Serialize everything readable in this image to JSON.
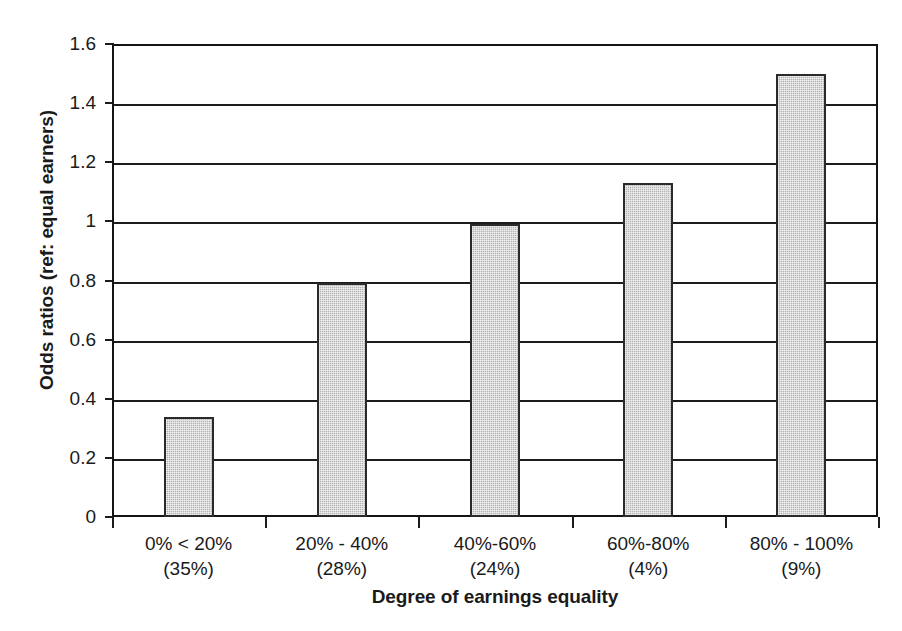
{
  "chart_data": {
    "type": "bar",
    "title": "",
    "xlabel": "Degree of earnings equality",
    "ylabel": "Odds ratios (ref: equal earners)",
    "categories": [
      "0% < 20%",
      "20% - 40%",
      "40%-60%",
      "60%-80%",
      "80% - 100%"
    ],
    "category_sublabels": [
      "(35%)",
      "(28%)",
      "(24%)",
      "(4%)",
      "(9%)"
    ],
    "values": [
      0.34,
      0.79,
      0.99,
      1.13,
      1.5
    ],
    "ylim": [
      0,
      1.6
    ],
    "ytick_labels": [
      "0",
      "0.2",
      "0.4",
      "0.6",
      "0.8",
      "1",
      "1.2",
      "1.4",
      "1.6"
    ],
    "ytick_values": [
      0,
      0.2,
      0.4,
      0.6,
      0.8,
      1.0,
      1.2,
      1.4,
      1.6
    ],
    "grid": true,
    "legend": "none",
    "bar_fill_color": "#b4b4b4",
    "bar_border_color": "#2a2a2a",
    "axis_color": "#1c1c1c",
    "background_color": "#ffffff"
  }
}
